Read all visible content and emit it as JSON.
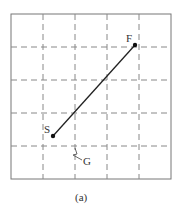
{
  "figure": {
    "caption": "(a)",
    "grid": {
      "columns": 5,
      "rows": 5,
      "border": {
        "x": 11,
        "y": 14,
        "width": 160,
        "height": 165
      },
      "vertical_lines_x": [
        43,
        75,
        107,
        139
      ],
      "horizontal_lines_y": [
        47,
        80,
        113,
        146
      ],
      "line_color": "#888888",
      "dash": "6,4"
    },
    "points": {
      "start": {
        "label": "S",
        "x": 53,
        "y": 136
      },
      "finish": {
        "label": "F",
        "x": 135,
        "y": 45
      }
    },
    "path_color": "#222222",
    "annotation": {
      "label": "G",
      "target_x": 75,
      "target_y": 146
    }
  }
}
